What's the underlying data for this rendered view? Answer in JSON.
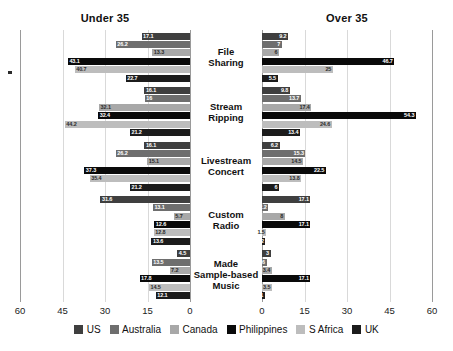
{
  "headings": {
    "left": "Under 35",
    "right": "Over 35"
  },
  "series_names": [
    "US",
    "Australia",
    "Canada",
    "Philippines",
    "S Africa",
    "UK"
  ],
  "series_colors": [
    "#3f3f3f",
    "#6e6e6e",
    "#a8a8a8",
    "#0a0a0a",
    "#bdbdbd",
    "#1c1c1c"
  ],
  "axis": {
    "left_ticks": [
      "60",
      "45",
      "30",
      "15",
      "0"
    ],
    "right_ticks": [
      "0",
      "15",
      "30",
      "45",
      "60"
    ],
    "max": 60,
    "tick_step": 15
  },
  "categories": [
    "File Sharing",
    "Stream Ripping",
    "Livestream Concert",
    "Custom Radio",
    "Made Sample-based Music"
  ],
  "chart_data": {
    "type": "bar",
    "title": "",
    "subtitle": "",
    "orientation": "horizontal",
    "layout": "butterfly-tornado-two-panel",
    "xlabel": "",
    "ylabel": "",
    "xlim": [
      0,
      60
    ],
    "grid": true,
    "legend_position": "bottom-center",
    "categories": [
      "File Sharing",
      "Stream Ripping",
      "Livestream Concert",
      "Custom Radio",
      "Made Sample-based Music"
    ],
    "panels": [
      {
        "name": "Under 35",
        "series": [
          {
            "name": "US",
            "values": [
              17.1,
              16.1,
              16.1,
              31.6,
              4.5
            ]
          },
          {
            "name": "Australia",
            "values": [
              26.2,
              16.0,
              26.2,
              13.1,
              13.5
            ]
          },
          {
            "name": "Canada",
            "values": [
              13.3,
              32.1,
              15.1,
              5.7,
              7.2
            ]
          },
          {
            "name": "Philippines",
            "values": [
              43.1,
              32.4,
              37.3,
              12.6,
              17.8
            ]
          },
          {
            "name": "S Africa",
            "values": [
              40.7,
              44.2,
              35.4,
              12.8,
              14.5
            ]
          },
          {
            "name": "UK",
            "values": [
              22.7,
              21.2,
              21.2,
              13.6,
              12.1
            ]
          }
        ]
      },
      {
        "name": "Over 35",
        "series": [
          {
            "name": "US",
            "values": [
              9.2,
              9.8,
              6.2,
              17.1,
              3.0
            ]
          },
          {
            "name": "Australia",
            "values": [
              7.0,
              13.7,
              15.3,
              2.2,
              1.6
            ]
          },
          {
            "name": "Canada",
            "values": [
              6.0,
              17.4,
              14.5,
              8.0,
              3.4
            ]
          },
          {
            "name": "Philippines",
            "values": [
              46.7,
              54.3,
              22.5,
              17.1,
              17.1
            ]
          },
          {
            "name": "S Africa",
            "values": [
              25.0,
              24.6,
              13.8,
              1.5,
              3.5
            ]
          },
          {
            "name": "UK",
            "values": [
              5.5,
              13.4,
              6.0,
              1.2,
              1.0
            ]
          }
        ]
      }
    ],
    "bar_labels": {
      "under35": [
        [
          "17.1",
          "26.2",
          "13.3",
          "43.1",
          "40.7",
          "22.7"
        ],
        [
          "16.1",
          "16",
          "32.1",
          "32.4",
          "44.2",
          "21.2"
        ],
        [
          "16.1",
          "26.2",
          "15.1",
          "37.3",
          "35.4",
          "21.2"
        ],
        [
          "31.6",
          "13.1",
          "5.7",
          "12.6",
          "12.8",
          "13.6"
        ],
        [
          "4.5",
          "13.5",
          "7.2",
          "17.8",
          "14.5",
          "12.1"
        ]
      ],
      "over35": [
        [
          "9.2",
          "7",
          "6",
          "46.7",
          "25",
          "5.5"
        ],
        [
          "9.8",
          "13.7",
          "17.4",
          "54.3",
          "24.6",
          "13.4"
        ],
        [
          "6.2",
          "15.3",
          "14.5",
          "22.5",
          "13.8",
          "6"
        ],
        [
          "17.1",
          "2.2",
          "8",
          "17.1",
          "1.5",
          "1.2"
        ],
        [
          "3",
          "1.6",
          "3.4",
          "17.1",
          "3.5",
          "1"
        ]
      ]
    }
  }
}
